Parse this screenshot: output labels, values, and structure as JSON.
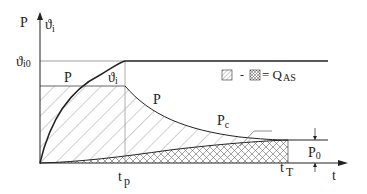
{
  "diagram": {
    "axes": {
      "y_label_power": "P",
      "y_label_temp": "ϑ",
      "y_label_temp_sub": "i",
      "x_label": "t"
    },
    "levels": {
      "temp_max_label": "ϑ",
      "temp_max_sub": "i0",
      "power_label": "P"
    },
    "curves": {
      "temp_curve_label": "ϑ",
      "temp_curve_sub": "i",
      "power_curve_label": "P",
      "cooling_curve_label": "P",
      "cooling_curve_sub": "c"
    },
    "time_marks": {
      "tp": "t",
      "tp_sub": "p",
      "tT": "t",
      "tT_sub": "T"
    },
    "baseline": {
      "label": "P",
      "label_sub": "0"
    },
    "legend": {
      "minus": "-",
      "equals": "= Q",
      "result_sub": "AS"
    },
    "colors": {
      "line": "#222222",
      "thin_line": "#888888",
      "hatch": "#777777"
    }
  }
}
